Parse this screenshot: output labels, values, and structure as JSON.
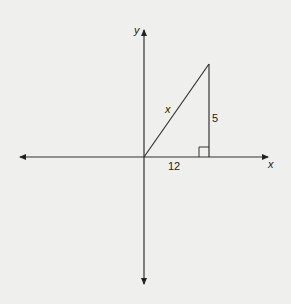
{
  "diagram": {
    "axes": {
      "x_label": "x",
      "y_label": "y"
    },
    "triangle": {
      "hypotenuse_label": "x",
      "base_label": "12",
      "height_label": "5",
      "right_angle": true
    }
  }
}
